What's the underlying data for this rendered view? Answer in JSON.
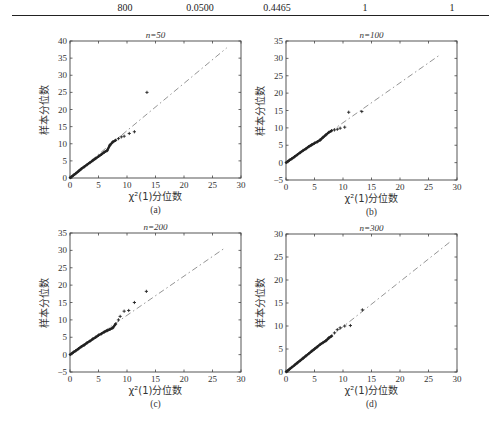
{
  "table_row": {
    "cells": [
      "800",
      "0.0500",
      "0.4465",
      "1",
      "1"
    ]
  },
  "chart_data": [
    {
      "type": "scatter",
      "panel": "(a)",
      "title": "n=50",
      "xlabel": "χ²(1)分位数",
      "ylabel": "样本分位数",
      "xlim": [
        0,
        30
      ],
      "ylim": [
        0,
        40
      ],
      "xticks": [
        0,
        5,
        10,
        15,
        20,
        25,
        30
      ],
      "yticks": [
        0,
        5,
        10,
        15,
        20,
        25,
        30,
        35,
        40
      ],
      "reference_line": {
        "style": "dash-dot",
        "from": [
          0,
          0
        ],
        "to": [
          27.5,
          38
        ]
      },
      "points": [
        [
          0.05,
          0.1
        ],
        [
          0.3,
          0.4
        ],
        [
          0.6,
          0.8
        ],
        [
          1,
          1.3
        ],
        [
          1.5,
          2
        ],
        [
          2,
          2.7
        ],
        [
          2.5,
          3.3
        ],
        [
          3,
          3.9
        ],
        [
          3.5,
          4.5
        ],
        [
          4,
          5.1
        ],
        [
          4.5,
          5.7
        ],
        [
          5,
          6.3
        ],
        [
          5.5,
          6.9
        ],
        [
          6,
          7.5
        ],
        [
          6.5,
          8
        ],
        [
          7,
          9.6
        ],
        [
          7.5,
          10.5
        ],
        [
          8,
          11
        ],
        [
          8.5,
          11.5
        ],
        [
          9,
          12
        ],
        [
          9.5,
          12.2
        ],
        [
          10.4,
          13
        ],
        [
          11.3,
          13.5
        ],
        [
          13.5,
          25
        ]
      ],
      "grid": false
    },
    {
      "type": "scatter",
      "panel": "(b)",
      "title": "n=100",
      "xlabel": "χ²(1)分位数",
      "ylabel": "样本分位数",
      "xlim": [
        0,
        30
      ],
      "ylim": [
        -5,
        35
      ],
      "xticks": [
        0,
        5,
        10,
        15,
        20,
        25,
        30
      ],
      "yticks": [
        -5,
        0,
        5,
        10,
        15,
        20,
        25,
        30,
        35
      ],
      "reference_line": {
        "style": "dash-dot",
        "from": [
          0,
          0
        ],
        "to": [
          27,
          31
        ]
      },
      "points": [
        [
          0.05,
          0.05
        ],
        [
          0.3,
          0.3
        ],
        [
          0.6,
          0.7
        ],
        [
          1,
          1.1
        ],
        [
          1.5,
          1.7
        ],
        [
          2,
          2.3
        ],
        [
          2.5,
          2.9
        ],
        [
          3,
          3.5
        ],
        [
          3.5,
          4
        ],
        [
          4,
          4.6
        ],
        [
          4.5,
          5.1
        ],
        [
          5,
          5.6
        ],
        [
          5.5,
          6
        ],
        [
          6,
          6.5
        ],
        [
          6.5,
          7.3
        ],
        [
          7,
          8
        ],
        [
          7.5,
          8.7
        ],
        [
          8,
          9.2
        ],
        [
          8.5,
          9.4
        ],
        [
          9,
          9.6
        ],
        [
          9.5,
          9.9
        ],
        [
          10.3,
          10.2
        ],
        [
          11,
          14.5
        ],
        [
          13.3,
          14.7
        ]
      ],
      "grid": false
    },
    {
      "type": "scatter",
      "panel": "(c)",
      "title": "n=200",
      "xlabel": "χ²(1)分位数",
      "ylabel": "样本分位数",
      "xlim": [
        0,
        30
      ],
      "ylim": [
        -5,
        35
      ],
      "xticks": [
        0,
        5,
        10,
        15,
        20,
        25,
        30
      ],
      "yticks": [
        -5,
        0,
        5,
        10,
        15,
        20,
        25,
        30,
        35
      ],
      "reference_line": {
        "style": "dash-dot",
        "from": [
          0,
          0
        ],
        "to": [
          27,
          30.5
        ]
      },
      "points": [
        [
          0.05,
          0.05
        ],
        [
          0.3,
          0.3
        ],
        [
          0.6,
          0.7
        ],
        [
          1,
          1.1
        ],
        [
          1.5,
          1.7
        ],
        [
          2,
          2.3
        ],
        [
          2.5,
          2.8
        ],
        [
          3,
          3.4
        ],
        [
          3.5,
          3.9
        ],
        [
          4,
          4.5
        ],
        [
          4.5,
          5
        ],
        [
          5,
          5.6
        ],
        [
          5.5,
          6
        ],
        [
          6,
          6.5
        ],
        [
          6.5,
          6.9
        ],
        [
          7,
          7.3
        ],
        [
          7.5,
          7.7
        ],
        [
          8,
          8.8
        ],
        [
          8.5,
          10
        ],
        [
          8.8,
          11
        ],
        [
          9.5,
          12.5
        ],
        [
          10.3,
          12.7
        ],
        [
          11.3,
          15
        ],
        [
          13.4,
          18.2
        ]
      ],
      "grid": false
    },
    {
      "type": "scatter",
      "panel": "(d)",
      "title": "n=300",
      "xlabel": "χ²(1)分位数",
      "ylabel": "样本分位数",
      "xlim": [
        0,
        30
      ],
      "ylim": [
        0,
        30
      ],
      "xticks": [
        0,
        5,
        10,
        15,
        20,
        25,
        30
      ],
      "yticks": [
        0,
        5,
        10,
        15,
        20,
        25,
        30
      ],
      "reference_line": {
        "style": "dash-dot",
        "from": [
          0,
          0
        ],
        "to": [
          29,
          28.5
        ]
      },
      "points": [
        [
          0.05,
          0.05
        ],
        [
          0.3,
          0.3
        ],
        [
          0.6,
          0.6
        ],
        [
          1,
          1
        ],
        [
          1.5,
          1.5
        ],
        [
          2,
          2
        ],
        [
          2.5,
          2.5
        ],
        [
          3,
          3
        ],
        [
          3.5,
          3.5
        ],
        [
          4,
          4
        ],
        [
          4.5,
          4.5
        ],
        [
          5,
          5
        ],
        [
          5.5,
          5.5
        ],
        [
          6,
          6
        ],
        [
          6.5,
          6.4
        ],
        [
          7,
          6.8
        ],
        [
          7.5,
          7.4
        ],
        [
          8,
          7.8
        ],
        [
          8.5,
          8.5
        ],
        [
          9,
          9.2
        ],
        [
          9.5,
          9.6
        ],
        [
          10.3,
          10
        ],
        [
          11.3,
          10.1
        ],
        [
          13.4,
          13.5
        ]
      ],
      "grid": false
    }
  ]
}
